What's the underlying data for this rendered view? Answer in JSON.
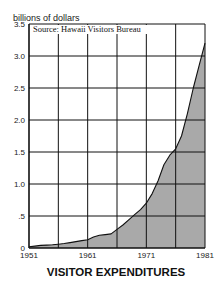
{
  "chart_data": {
    "type": "area",
    "title": "VISITOR EXPENDITURES",
    "ylabel": "billions of dollars",
    "xlabel": "",
    "source_note": "Source: Hawaii Visitors Bureau",
    "x": [
      1951,
      1952,
      1953,
      1954,
      1955,
      1956,
      1957,
      1958,
      1959,
      1960,
      1961,
      1962,
      1963,
      1964,
      1965,
      1966,
      1967,
      1968,
      1969,
      1970,
      1971,
      1972,
      1973,
      1974,
      1975,
      1976,
      1977,
      1978,
      1979,
      1980,
      1981
    ],
    "series": [
      {
        "name": "Visitor expenditures",
        "values": [
          0.02,
          0.03,
          0.04,
          0.045,
          0.05,
          0.06,
          0.07,
          0.085,
          0.1,
          0.115,
          0.13,
          0.17,
          0.2,
          0.21,
          0.22,
          0.29,
          0.36,
          0.44,
          0.52,
          0.6,
          0.7,
          0.85,
          1.05,
          1.3,
          1.45,
          1.55,
          1.75,
          2.1,
          2.5,
          2.85,
          3.2
        ],
        "fill": "#a9a9a9",
        "line": "#111111"
      }
    ],
    "xlim": [
      1951,
      1981
    ],
    "ylim": [
      0,
      3.5
    ],
    "x_ticks": [
      1951,
      1956,
      1961,
      1966,
      1971,
      1976,
      1981
    ],
    "x_tick_labels": [
      "1951",
      "",
      "1961",
      "",
      "1971",
      "",
      "1981"
    ],
    "y_ticks": [
      0,
      0.5,
      1.0,
      1.5,
      2.0,
      2.5,
      3.0,
      3.5
    ],
    "y_tick_labels": [
      "0",
      ".5",
      "1.0",
      "1.5",
      "2.0",
      "2.5",
      "3.0",
      "3.5"
    ],
    "grid": true,
    "legend": null
  }
}
